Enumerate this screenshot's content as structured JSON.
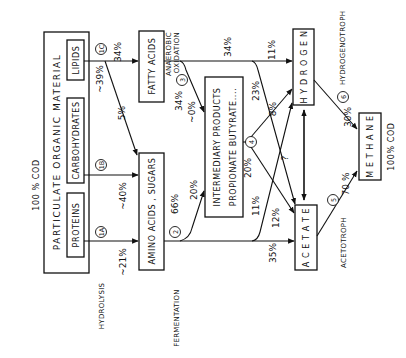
{
  "diagram": {
    "title_top": "100 % COD",
    "source_box": {
      "title": "PARTICULATE  ORGANIC  MATERIAL",
      "components": [
        "PROTEINS",
        "CARBOHYDRATES",
        "LIPIDS"
      ]
    },
    "nodes": {
      "amino": "AMINO ACIDS , SUGARS",
      "fatty": "FATTY  ACIDS",
      "intermediary_line1": "INTERMEDIARY  PRODUCTS",
      "intermediary_line2": "PROPIONATE  BUTYRATE....",
      "hydrogen": "H Y D R O G E N",
      "acetate": "A C E T A T E",
      "methane": "M E T H A N E",
      "methane_cod": "100% COD"
    },
    "processes": {
      "hydrolysis": "HYDROLYSIS",
      "fermentation": "FERMENTATION",
      "anaerobic_oxidation_1": "ANAEROBIC",
      "anaerobic_oxidation_2": "OXIDATION",
      "hydrogenotroph": "HYDROGENOTROPH",
      "acetotroph": "ACETOTROPH"
    },
    "step_labels": {
      "s1a": "1A",
      "s1b": "1B",
      "s1c": "1C",
      "s2": "2",
      "s3": "3",
      "s4": "4",
      "s5": "5",
      "s6": "6"
    },
    "flows": {
      "proteins_to_amino": "~21%",
      "carbs_to_amino": "~40%",
      "lipids_to_amino": "5%",
      "lipids_total": "~39%",
      "lipids_to_fatty": "34%",
      "amino_total": "66%",
      "amino_to_intermediary": "20%",
      "amino_to_acetate": "35%",
      "amino_to_hydrogen": "11%",
      "fatty_total": "34%",
      "fatty_to_intermediary": "~0%",
      "fatty_to_hydrogen": "11%",
      "fatty_to_acetate": "23%",
      "fatty_top": "34%",
      "intermediary_to_hydrogen": "8%",
      "intermediary_to_acetate": "12%",
      "intermediary_total": "20%",
      "hydrogen_acetate": "?",
      "hydrogen_to_methane": "30%",
      "acetate_to_methane": "70 %"
    }
  }
}
